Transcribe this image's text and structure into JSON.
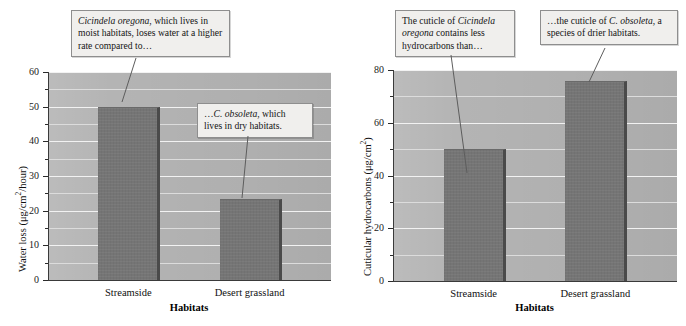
{
  "figure": {
    "panels": [
      {
        "id": "water-loss",
        "y_title_main": "Water loss (μg/cm",
        "y_title_sup": "2",
        "y_title_tail": "/hour)",
        "x_title": "Habitats",
        "categories": [
          "Streamside",
          "Desert grassland"
        ],
        "tick_labels": [
          "0",
          "10",
          "20",
          "30",
          "40",
          "50",
          "60"
        ]
      },
      {
        "id": "cuticular-hydrocarbons",
        "y_title_main": "Cuticular hydrocarbons (μg/cm",
        "y_title_sup": "2",
        "y_title_tail": ")",
        "x_title": "Habitats",
        "categories": [
          "Streamside",
          "Desert grassland"
        ],
        "tick_labels": [
          "0",
          "20",
          "40",
          "60",
          "80"
        ]
      }
    ],
    "callouts": [
      {
        "id": "callout-oregona-water",
        "segments": [
          {
            "text": "Cicindela oregona",
            "italic": true
          },
          {
            "text": ", which lives in moist habitats, loses water at a higher rate compared to…",
            "italic": false
          }
        ]
      },
      {
        "id": "callout-obsoleta-water",
        "segments": [
          {
            "text": "…",
            "italic": false
          },
          {
            "text": "C. obsoleta",
            "italic": true
          },
          {
            "text": ", which lives in dry habitats.",
            "italic": false
          }
        ]
      },
      {
        "id": "callout-oregona-cuticle",
        "segments": [
          {
            "text": "The cuticle of ",
            "italic": false
          },
          {
            "text": "Cicindela oregona",
            "italic": true
          },
          {
            "text": " contains less hydrocarbons than…",
            "italic": false
          }
        ]
      },
      {
        "id": "callout-obsoleta-cuticle",
        "segments": [
          {
            "text": "…the cuticle of ",
            "italic": false
          },
          {
            "text": "C. obsoleta",
            "italic": true
          },
          {
            "text": ", a species of drier habitats.",
            "italic": false
          }
        ]
      }
    ],
    "colors": {
      "bar_fill": "#757575",
      "bar_edge": "#4a4a4a",
      "plot_background": "#b4b4b4",
      "gridline": "#f2f2f2",
      "callout_background": "#f0efed",
      "callout_border": "#8e8e8e"
    }
  },
  "chart_data": [
    {
      "type": "bar",
      "title": "",
      "xlabel": "Habitats",
      "ylabel": "Water loss (μg/cm2/hour)",
      "categories": [
        "Streamside",
        "Desert grassland"
      ],
      "values": [
        50,
        23.5
      ],
      "ylim": [
        0,
        60
      ],
      "ymajor_ticks": [
        0,
        10,
        20,
        30,
        40,
        50,
        60
      ],
      "yminor_ticks": [
        5,
        15,
        25,
        35,
        45,
        55
      ],
      "grid": true,
      "legend": "none",
      "annotations": [
        "Cicindela oregona, which lives in moist habitats, loses water at a higher rate compared to…",
        "…C. obsoleta, which lives in dry habitats."
      ]
    },
    {
      "type": "bar",
      "title": "",
      "xlabel": "Habitats",
      "ylabel": "Cuticular hydrocarbons (μg/cm2)",
      "categories": [
        "Streamside",
        "Desert grassland"
      ],
      "values": [
        50,
        76
      ],
      "ylim": [
        0,
        80
      ],
      "ymajor_ticks": [
        0,
        20,
        40,
        60,
        80
      ],
      "yminor_ticks": [
        10,
        30,
        50,
        70
      ],
      "grid": true,
      "legend": "none",
      "annotations": [
        "The cuticle of Cicindela oregona contains less hydrocarbons than…",
        "…the cuticle of C. obsoleta, a species of drier habitats."
      ]
    }
  ]
}
